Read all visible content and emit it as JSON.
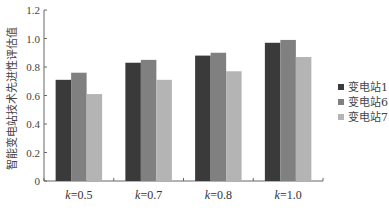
{
  "chart_data": {
    "type": "bar",
    "title": "",
    "xlabel": "",
    "ylabel": "智能变电站技术先进性评估值",
    "ylim": [
      0,
      1.2
    ],
    "yticks": [
      "0",
      "0.2",
      "0.4",
      "0.6",
      "0.8",
      "1.0",
      "1.2"
    ],
    "grid": false,
    "legend_position": "right",
    "categories": [
      "k=0.5",
      "k=0.7",
      "k=0.8",
      "k=1.0"
    ],
    "category_prefix": "k",
    "category_values": [
      "=0.5",
      "=0.7",
      "=0.8",
      "=1.0"
    ],
    "series": [
      {
        "name": "变电站1",
        "color": "#3a3a3a",
        "values": [
          0.71,
          0.83,
          0.88,
          0.97
        ]
      },
      {
        "name": "变电站6",
        "color": "#808080",
        "values": [
          0.76,
          0.85,
          0.9,
          0.99
        ]
      },
      {
        "name": "变电站7",
        "color": "#b4b4b4",
        "values": [
          0.61,
          0.71,
          0.77,
          0.87
        ]
      }
    ]
  }
}
